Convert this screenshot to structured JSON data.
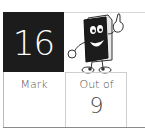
{
  "score": {
    "value": "16",
    "background": "#1c1c1c",
    "text_color": "#ffffff"
  },
  "mascot": {
    "icon": "book-mascot-icon"
  },
  "table": {
    "mark_label": "Mark",
    "out_of_label": "Out of",
    "out_of_value": "9",
    "mark_value": ""
  }
}
